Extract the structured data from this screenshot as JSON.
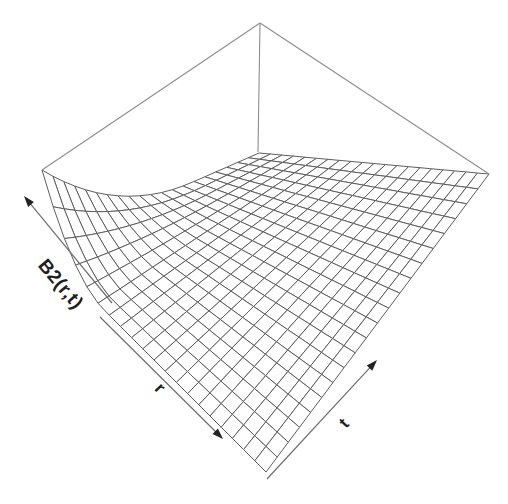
{
  "figure": {
    "background": "#ffffff",
    "z_axis_label": "B2(r,t)",
    "x_axis_label": "r",
    "y_axis_label": "t"
  },
  "chart_data": {
    "type": "3d-surface-wireframe",
    "title": "",
    "xlabel": "r",
    "ylabel": "t",
    "zlabel": "B2(r,t)",
    "tick_labels": "none",
    "grid": "wireframe mesh on surface",
    "legend": "none",
    "surface_description": "B2(r,t) is maximal at the (r=0, t=0) left corner forming a steep cliff/ridge, decays rapidly with increasing r and t, and is flat (≈0) over most of the domain",
    "mesh": {
      "divisions_r": 20,
      "divisions_t": 20
    },
    "surface": {
      "decay_r": 3.6,
      "decay_t": 1.45,
      "exponent": 2,
      "peak_z": 1.0
    },
    "projection": {
      "floor_left": [
        42,
        248
      ],
      "floor_back": [
        259,
        153
      ],
      "floor_right": [
        489,
        174
      ],
      "floor_front": [
        266,
        472
      ],
      "apex": [
        260,
        23
      ],
      "back_axis_bottom": [
        258,
        152
      ],
      "peak_height_px": 78
    },
    "axis_arrows": [
      {
        "name": "z-axis-arrow",
        "tail": [
          112,
          303
        ],
        "tip": [
          24,
          196
        ]
      },
      {
        "name": "r-axis-arrow",
        "tail": [
          100,
          317
        ],
        "tip": [
          223,
          439
        ]
      },
      {
        "name": "t-axis-arrow",
        "tail": [
          267,
          479
        ],
        "tip": [
          377,
          360
        ]
      }
    ],
    "styles": {
      "background": "#ffffff",
      "mesh_stroke": "#5e5e5e",
      "mesh_fill": "#ffffff",
      "frame_stroke": "#8d8d8d",
      "axis_stroke": "#6f6f6f",
      "ink": "#222222"
    }
  }
}
